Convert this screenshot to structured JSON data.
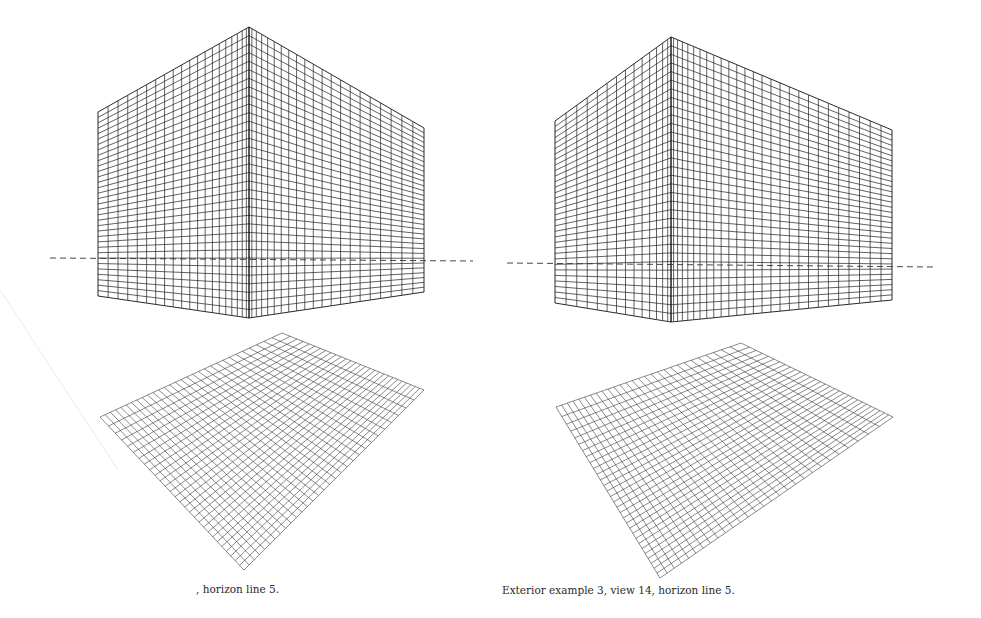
{
  "page": {
    "background": "#ffffff",
    "ink_color": "#1e1e1e"
  },
  "figures": [
    {
      "id": "left",
      "caption": ", horizon line 5.",
      "box": {
        "top_corner": [
          249,
          27
        ],
        "bottom_corner": [
          249,
          318
        ],
        "left_wall": {
          "x": 98,
          "top": 112,
          "bottom": 296,
          "columns": 20
        },
        "right_wall": {
          "x": 424,
          "top": 128,
          "bottom": 292,
          "columns": 21
        },
        "rows": 34
      },
      "horizon": {
        "x1": 50,
        "y1": 258,
        "x2": 473,
        "y2": 261
      },
      "floor": {
        "corners": [
          [
            282,
            333
          ],
          [
            424,
            390
          ],
          [
            244,
            570
          ],
          [
            100,
            417
          ]
        ],
        "divisions_a": 28,
        "divisions_b": 30
      }
    },
    {
      "id": "right",
      "caption": "Exterior example 3, view 14, horizon line 5.",
      "box": {
        "top_corner": [
          671,
          37
        ],
        "bottom_corner": [
          670,
          322
        ],
        "left_wall": {
          "x": 555,
          "top": 121,
          "bottom": 303,
          "columns": 14
        },
        "right_wall": {
          "x": 892,
          "top": 130,
          "bottom": 300,
          "columns": 27
        },
        "rows": 33
      },
      "horizon": {
        "x1": 507,
        "y1": 263,
        "x2": 935,
        "y2": 267
      },
      "floor": {
        "corners": [
          [
            741,
            343
          ],
          [
            893,
            417
          ],
          [
            660,
            578
          ],
          [
            556,
            407
          ]
        ],
        "divisions_a": 30,
        "divisions_b": 28
      }
    }
  ],
  "smudge": {
    "x1": 0,
    "y1": 290,
    "x2": 118,
    "y2": 470
  }
}
